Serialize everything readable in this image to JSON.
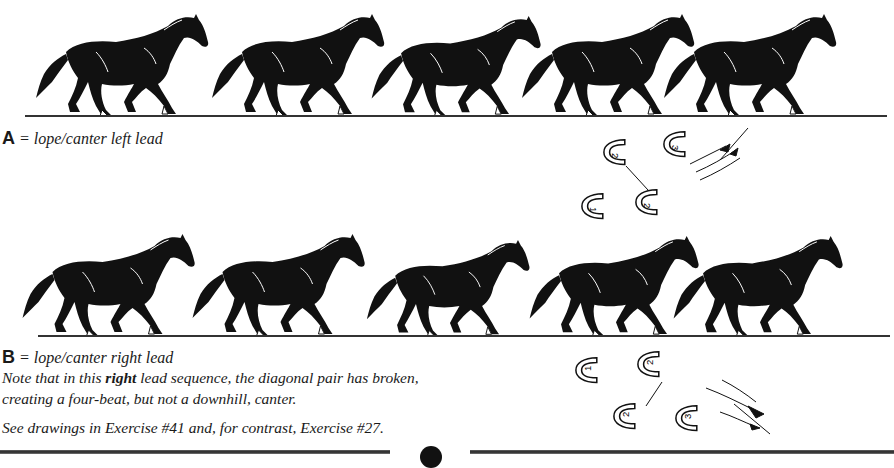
{
  "section_a": {
    "letter": "A",
    "equals": " = ",
    "caption": "lope/canter left lead",
    "horse_count": 5,
    "hoof_diagram": {
      "hooves": [
        {
          "label": "2",
          "position": "upper-left"
        },
        {
          "label": "3",
          "position": "upper-right"
        },
        {
          "label": "1",
          "position": "lower-left"
        },
        {
          "label": "2",
          "position": "lower-right"
        }
      ],
      "direction_icon": "motion-arrows-icon"
    }
  },
  "section_b": {
    "letter": "B",
    "equals": " = ",
    "caption": "lope/canter right lead",
    "note_before": "Note that in this ",
    "note_bold": "right",
    "note_after": " lead sequence, the diagonal pair has broken,",
    "note_line2": "creating a four-beat, but not a downhill, canter.",
    "see_also": "See drawings in Exercise #41 and, for contrast, Exercise #27.",
    "horse_count": 5,
    "hoof_diagram": {
      "hooves": [
        {
          "label": "1",
          "position": "upper-left"
        },
        {
          "label": "2",
          "position": "upper-middle"
        },
        {
          "label": "2",
          "position": "lower-middle"
        },
        {
          "label": "3",
          "position": "lower-right"
        }
      ],
      "direction_icon": "motion-arrows-icon"
    }
  },
  "colors": {
    "ink": "#111111",
    "paper": "#ffffff"
  }
}
